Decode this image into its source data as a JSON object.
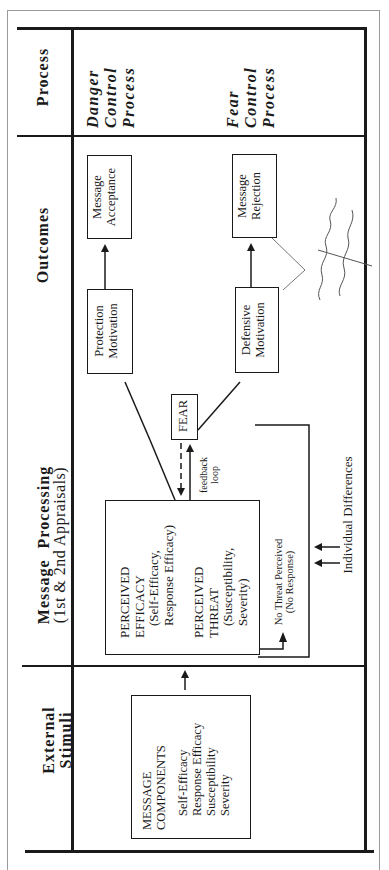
{
  "diagram": {
    "row_headers": {
      "process": "Process",
      "outcomes": "Outcomes",
      "message_processing": "Message Processing",
      "message_processing_sub": "(1st & 2nd Appraisals)",
      "external_stimuli_line1": "External",
      "external_stimuli_line2": "Stimuli"
    },
    "processes": {
      "danger": [
        "Danger",
        "Control",
        "Process"
      ],
      "fear": [
        "Fear",
        "Control",
        "Process"
      ]
    },
    "nodes": {
      "message_acceptance": [
        "Message",
        "Acceptance"
      ],
      "message_rejection": [
        "Message",
        "Rejection"
      ],
      "protection_motivation": [
        "Protection",
        "Motivation"
      ],
      "defensive_motivation": [
        "Defensive",
        "Motivation"
      ],
      "fear": "FEAR",
      "perceived_efficacy": [
        "PERCEIVED",
        "EFFICACY",
        "(Self-Efficacy,",
        "Response Efficacy)"
      ],
      "perceived_threat": [
        "PERCEIVED",
        "THREAT",
        "(Susceptibility,",
        "Severity)"
      ],
      "no_threat": [
        "No Threat Perceived",
        "(No Response)"
      ],
      "message_components_title": [
        "MESSAGE",
        "COMPONENTS"
      ],
      "message_components_items": [
        "Self-Efficacy",
        "Response Efficacy",
        "Susceptibility",
        "Severity"
      ]
    },
    "labels": {
      "feedback": [
        "feedback",
        "loop"
      ],
      "individual_differences": "Individual Differences"
    },
    "annotation": {
      "handwritten": "controlling fear"
    }
  }
}
